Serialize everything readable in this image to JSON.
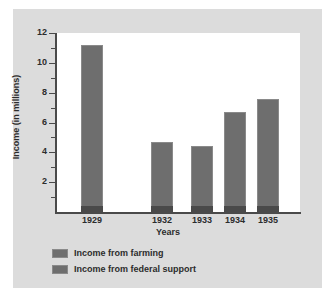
{
  "chart_data": {
    "type": "bar",
    "title": "",
    "xlabel": "Years",
    "ylabel": "Income (in millions)",
    "categories": [
      "1929",
      "1932",
      "1933",
      "1934",
      "1935"
    ],
    "values": [
      11.2,
      4.7,
      4.4,
      6.7,
      7.6
    ],
    "series": [
      {
        "name": "Income from farming",
        "values": [
          11.2,
          4.7,
          4.4,
          6.7,
          7.6
        ]
      }
    ],
    "ylim": [
      0,
      12
    ],
    "yticks": [
      2,
      4,
      6,
      8,
      10,
      12
    ],
    "ytick_labels": [
      "2",
      "4",
      "6",
      "8",
      "10",
      "12"
    ],
    "yminor_ticks": [
      1,
      3,
      5,
      7,
      9,
      11
    ],
    "grid": false,
    "legend_position": "below",
    "legend": [
      {
        "label": "Income from farming",
        "color": "#6e6e6e"
      },
      {
        "label": "Income from federal support",
        "color": "#6e6e6e"
      }
    ],
    "bar_color": "#6e6e6e",
    "plot_background": "#ffffff",
    "panel_background": "#dcdcdc",
    "axis_color": "#4a4a4a"
  }
}
